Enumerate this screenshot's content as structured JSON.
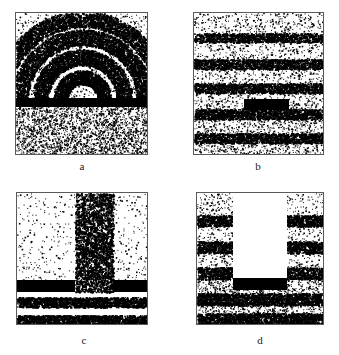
{
  "figure": {
    "background_color": "#ffffff",
    "border_color": "#5a5a5a",
    "dot_color": "#000000",
    "obstacle_color": "#000000",
    "panel_count": 4,
    "layout": "2x2 grid"
  },
  "panels": [
    {
      "id": "a",
      "caption": "a",
      "x": 15,
      "y": 12,
      "w": 133,
      "h": 143,
      "caption_x": 62,
      "caption_y": 160,
      "caption_w": 40,
      "pattern": "circular-arcs",
      "description": "Concentric circular arc wavefronts above a full-width barrier, uniform random dots below",
      "bars": [
        {
          "x": 0,
          "y": 85,
          "w": 133,
          "h": 9,
          "label": "full-width-barrier"
        }
      ],
      "arcs": [
        {
          "cx": 66,
          "cy": 86,
          "r": 22,
          "thickness": 7,
          "density": 1500
        },
        {
          "cx": 66,
          "cy": 86,
          "r": 42,
          "thickness": 8,
          "density": 2400
        },
        {
          "cx": 66,
          "cy": 86,
          "r": 62,
          "thickness": 8,
          "density": 3200
        },
        {
          "cx": 66,
          "cy": 86,
          "r": 80,
          "thickness": 8,
          "density": 3600
        }
      ],
      "background_density": {
        "top": 900,
        "bottom": 2600
      },
      "white_regions": []
    },
    {
      "id": "b",
      "caption": "b",
      "x": 193,
      "y": 12,
      "w": 131,
      "h": 143,
      "caption_x": 238,
      "caption_y": 160,
      "caption_w": 40,
      "pattern": "horizontal-bands",
      "description": "Horizontal plane-wave bands across full width with a short central barrier",
      "bars": [
        {
          "x": 50,
          "y": 86,
          "w": 45,
          "h": 11,
          "label": "short-central-barrier"
        }
      ],
      "bands": [
        {
          "y": 20,
          "h": 9,
          "density": 1100
        },
        {
          "y": 46,
          "h": 10,
          "density": 1300
        },
        {
          "y": 70,
          "h": 10,
          "density": 1300
        },
        {
          "y": 96,
          "h": 10,
          "density": 1300
        },
        {
          "y": 120,
          "h": 10,
          "density": 1300
        }
      ],
      "background_density": {
        "top": 1400,
        "bottom": 1400
      },
      "white_regions": []
    },
    {
      "id": "c",
      "caption": "c",
      "x": 16,
      "y": 192,
      "w": 132,
      "h": 133,
      "caption_x": 64,
      "caption_y": 334,
      "caption_w": 40,
      "pattern": "vertical-beam-through-slit",
      "description": "Dense vertical beam column passing through a gap between two barriers, horizontal bands below",
      "bars": [
        {
          "x": 0,
          "y": 87,
          "w": 58,
          "h": 12,
          "label": "left-barrier"
        },
        {
          "x": 96,
          "y": 87,
          "w": 36,
          "h": 12,
          "label": "right-barrier"
        }
      ],
      "beam": {
        "x": 58,
        "w": 38,
        "y": 0,
        "h": 99,
        "density": 2600
      },
      "bands": [
        {
          "y": 104,
          "h": 10,
          "density": 1700
        },
        {
          "y": 122,
          "h": 9,
          "density": 1500
        }
      ],
      "background_density": {
        "top": 520,
        "bottom": 0
      },
      "white_regions": []
    },
    {
      "id": "d",
      "caption": "d",
      "x": 196,
      "y": 192,
      "w": 128,
      "h": 133,
      "caption_x": 240,
      "caption_y": 334,
      "caption_w": 40,
      "pattern": "shadow-above-barrier",
      "description": "White shadow column above a central barrier, dense horizontal bands on both flanking sides",
      "bars": [
        {
          "x": 36,
          "y": 85,
          "w": 54,
          "h": 12,
          "label": "central-barrier"
        }
      ],
      "bands": [
        {
          "y": 22,
          "h": 11,
          "density": 1500
        },
        {
          "y": 48,
          "h": 12,
          "density": 1600
        },
        {
          "y": 74,
          "h": 12,
          "density": 1600
        },
        {
          "y": 100,
          "h": 12,
          "density": 1700
        },
        {
          "y": 120,
          "h": 11,
          "density": 1500
        }
      ],
      "background_density": {
        "top": 1200,
        "bottom": 1200
      },
      "white_regions": [
        {
          "x": 36,
          "y": 0,
          "w": 54,
          "h": 85,
          "label": "shadow-column"
        }
      ]
    }
  ]
}
